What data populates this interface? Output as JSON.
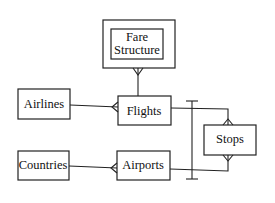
{
  "diagram": {
    "type": "entity-relationship",
    "notation": "crow's foot",
    "entities": [
      {
        "id": "fare_structure",
        "label_lines": [
          "Fare",
          "Structure"
        ],
        "weak": true
      },
      {
        "id": "airlines",
        "label": "Airlines"
      },
      {
        "id": "flights",
        "label": "Flights"
      },
      {
        "id": "countries",
        "label": "Countries"
      },
      {
        "id": "airports",
        "label": "Airports"
      },
      {
        "id": "stops",
        "label": "Stops"
      }
    ],
    "relationships": [
      {
        "from": "flights",
        "to": "fare_structure",
        "many_end": "fare_structure"
      },
      {
        "from": "airlines",
        "to": "flights",
        "many_end": "flights"
      },
      {
        "from": "countries",
        "to": "airports",
        "many_end": "airports"
      },
      {
        "from": "flights",
        "to": "stops",
        "many_end": "stops"
      },
      {
        "from": "airports",
        "to": "stops",
        "many_end": "stops"
      },
      {
        "type": "exclusive-arc",
        "spans": [
          "flights-stops",
          "airports-stops"
        ]
      }
    ]
  }
}
